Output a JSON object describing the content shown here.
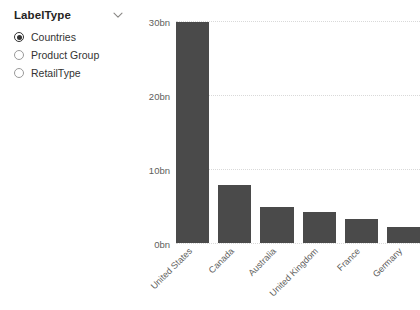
{
  "slicer": {
    "title": "LabelType",
    "expand_icon": "chevron-down-icon",
    "options": [
      {
        "label": "Countries",
        "selected": true
      },
      {
        "label": "Product Group",
        "selected": false
      },
      {
        "label": "RetailType",
        "selected": false
      }
    ]
  },
  "chart_data": {
    "type": "bar",
    "title": "",
    "xlabel": "",
    "ylabel": "",
    "categories": [
      "United States",
      "Canada",
      "Australia",
      "United Kingdom",
      "France",
      "Germany"
    ],
    "values": [
      29.9,
      7.8,
      4.9,
      4.2,
      3.2,
      2.2
    ],
    "ytick_labels": [
      "0bn",
      "10bn",
      "20bn",
      "30bn"
    ],
    "ytick_values": [
      0,
      10,
      20,
      30
    ],
    "ylim": [
      0,
      30
    ],
    "grid": true,
    "legend": "none",
    "bar_color": "#4a4a4a",
    "gridline_color": "#d9d9d9",
    "axis_text_color": "#605e5c"
  }
}
